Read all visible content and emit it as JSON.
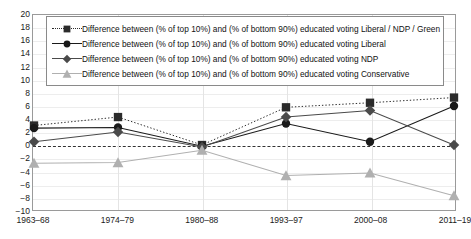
{
  "chart_data": {
    "type": "line",
    "title": "",
    "xlabel": "",
    "ylabel": "",
    "categories": [
      "1963–68",
      "1974–79",
      "1980–88",
      "1993–97",
      "2000–08",
      "2011–19"
    ],
    "ylim": [
      -10,
      20
    ],
    "ytick_step": 2,
    "yticks": [
      "20",
      "18",
      "16",
      "14",
      "12",
      "10",
      "8",
      "6",
      "4",
      "2",
      "0",
      "−2",
      "−4",
      "−6",
      "−8",
      "−10"
    ],
    "grid": true,
    "legend_position": "top-inside",
    "zero_reference_line": true,
    "series": [
      {
        "name": "Difference between (% of top 10%) and (% of bottom 90%) educated voting Liberal / NDP / Green",
        "marker": "square",
        "line_style": "dotted",
        "color": "#2b2b2b",
        "values": [
          3.0,
          4.3,
          0.0,
          5.8,
          6.5,
          7.3
        ]
      },
      {
        "name": "Difference between (% of top 10%) and (% of bottom 90%) educated voting Liberal",
        "marker": "circle",
        "line_style": "solid",
        "color": "#1a1a1a",
        "values": [
          2.6,
          2.7,
          -0.2,
          3.3,
          0.5,
          6.0
        ]
      },
      {
        "name": "Difference between (% of top 10%) and (% of bottom 90%) educated voting NDP",
        "marker": "diamond",
        "line_style": "solid",
        "color": "#4a4a4a",
        "values": [
          0.5,
          2.0,
          -0.3,
          4.3,
          5.3,
          0.0
        ]
      },
      {
        "name": "Difference between (% of top 10%) and (% of bottom 90%) educated voting Conservative",
        "marker": "triangle",
        "line_style": "solid",
        "color": "#b0b0b0",
        "values": [
          -2.8,
          -2.7,
          -0.8,
          -4.7,
          -4.3,
          -7.8
        ]
      }
    ]
  }
}
